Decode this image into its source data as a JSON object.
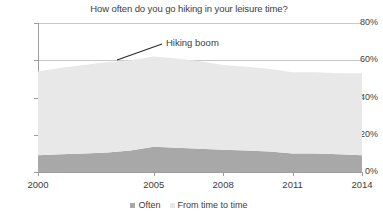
{
  "chart_data": {
    "type": "area",
    "title": "How often do you go hiking in your leisure time?",
    "xlabel": "",
    "ylabel": "",
    "stacked": true,
    "grid": true,
    "legend_position": "bottom",
    "ylim": [
      0,
      80
    ],
    "ytick_labels": [
      "0%",
      "20%",
      "40%",
      "60%",
      "80%"
    ],
    "ytick_values": [
      0,
      20,
      40,
      60,
      80
    ],
    "xtick_labels": [
      "2000",
      "2005",
      "2008",
      "2011",
      "2014"
    ],
    "xtick_values": [
      2000,
      2005,
      2008,
      2011,
      2014
    ],
    "x": [
      2000,
      2001,
      2002,
      2003,
      2004,
      2005,
      2006,
      2007,
      2008,
      2009,
      2010,
      2011,
      2012,
      2013,
      2014
    ],
    "series": [
      {
        "name": "Often",
        "color": "#a8a8a8",
        "values": [
          9,
          9.5,
          10,
          10.5,
          11.5,
          13.5,
          13,
          12.5,
          12,
          11.5,
          11,
          10,
          10,
          9.5,
          9
        ]
      },
      {
        "name": "From time to time",
        "color": "#e8e8e8",
        "values": [
          45,
          46.5,
          47.5,
          48.5,
          48.5,
          48.5,
          48,
          47,
          45.5,
          45,
          44.5,
          43.5,
          43.5,
          43.5,
          44
        ]
      }
    ],
    "totals": [
      54,
      56,
      57.5,
      59,
      60,
      62,
      61,
      59.5,
      57.5,
      56.5,
      55.5,
      53.5,
      53.5,
      53,
      53
    ],
    "annotations": [
      {
        "text": "Hiking boom",
        "label_x": 166,
        "label_y": 38,
        "line_from_x": 117,
        "line_from_y": 60,
        "line_to_x": 162,
        "line_to_y": 44
      }
    ]
  },
  "legend": {
    "items": [
      {
        "label": "Often",
        "color": "#a8a8a8"
      },
      {
        "label": "From time to time",
        "color": "#e8e8e8"
      }
    ]
  }
}
